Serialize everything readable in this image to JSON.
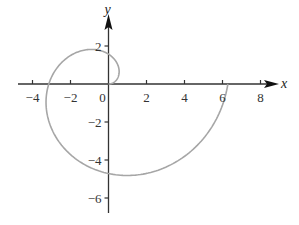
{
  "chart_data": {
    "type": "line",
    "title": "",
    "xlabel": "x",
    "ylabel": "y",
    "xlim": [
      -4.5,
      9
    ],
    "ylim": [
      -6.8,
      3.5
    ],
    "x_ticks": [
      -4,
      -2,
      0,
      2,
      4,
      6,
      8
    ],
    "y_ticks": [
      2,
      -2,
      -4,
      -6
    ],
    "x_tick_labels": [
      "−4",
      "−2",
      "0",
      "2",
      "4",
      "6",
      "8"
    ],
    "y_tick_labels": [
      "2",
      "−2",
      "−4",
      "−6"
    ],
    "grid": false,
    "legend": null,
    "series": [
      {
        "name": "spiral",
        "color": "#a6a6a6",
        "polar": {
          "r": "theta",
          "theta_range": [
            0,
            6.2832
          ]
        },
        "key_points": [
          {
            "x": 0,
            "y": 0
          },
          {
            "x": 0,
            "y": 1.57
          },
          {
            "x": -3.14,
            "y": 0
          },
          {
            "x": 0,
            "y": -4.71
          },
          {
            "x": 6.28,
            "y": 0
          }
        ]
      }
    ]
  },
  "colors": {
    "axis": "#333333",
    "curve": "#a6a6a6"
  }
}
